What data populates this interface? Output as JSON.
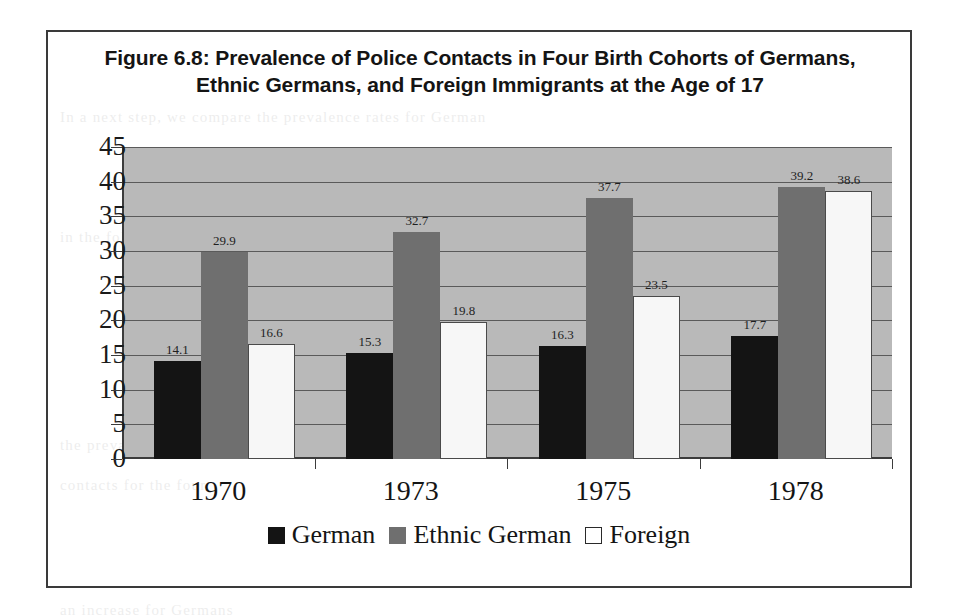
{
  "figure": {
    "title": "Figure 6.8: Prevalence of Police Contacts in Four Birth Cohorts of Germans, Ethnic Germans, and Foreign Immigrants at the Age of 17"
  },
  "colors": {
    "german": "#141414",
    "ethnic_german": "#6f6f6f",
    "foreign": "#f7f7f7",
    "plot_background": "#b9b9b9",
    "axis": "#3c3c3c",
    "frame": "#3a3a3a"
  },
  "chart_data": {
    "type": "bar",
    "title": "Figure 6.8: Prevalence of Police Contacts in Four Birth Cohorts of Germans, Ethnic Germans, and Foreign Immigrants at the Age of 17",
    "xlabel": "",
    "ylabel": "",
    "categories": [
      "1970",
      "1973",
      "1975",
      "1978"
    ],
    "series": [
      {
        "name": "German",
        "values": [
          14.1,
          15.3,
          16.3,
          17.7
        ]
      },
      {
        "name": "Ethnic German",
        "values": [
          29.9,
          32.7,
          37.7,
          39.2
        ]
      },
      {
        "name": "Foreign",
        "values": [
          16.6,
          19.8,
          23.5,
          38.6
        ]
      }
    ],
    "ylim": [
      0,
      45
    ],
    "ytick_labels": [
      "45",
      "40",
      "35",
      "30",
      "25",
      "20",
      "15",
      "10",
      "5",
      "0"
    ],
    "ytick_values": [
      45,
      40,
      35,
      30,
      25,
      20,
      15,
      10,
      5,
      0
    ],
    "grid": true,
    "legend_position": "bottom",
    "data_labels": true
  },
  "page_bleed": {
    "lines": [
      "the Age of 17",
      "In a next step, we compare the prevalence rates for German",
      "and foreign",
      "cohorts at the age of 17",
      "in the following",
      "the prevalence of police",
      "contacts for the four",
      "birth cohorts",
      "considerably",
      "an increase for Germans",
      "as well"
    ]
  }
}
